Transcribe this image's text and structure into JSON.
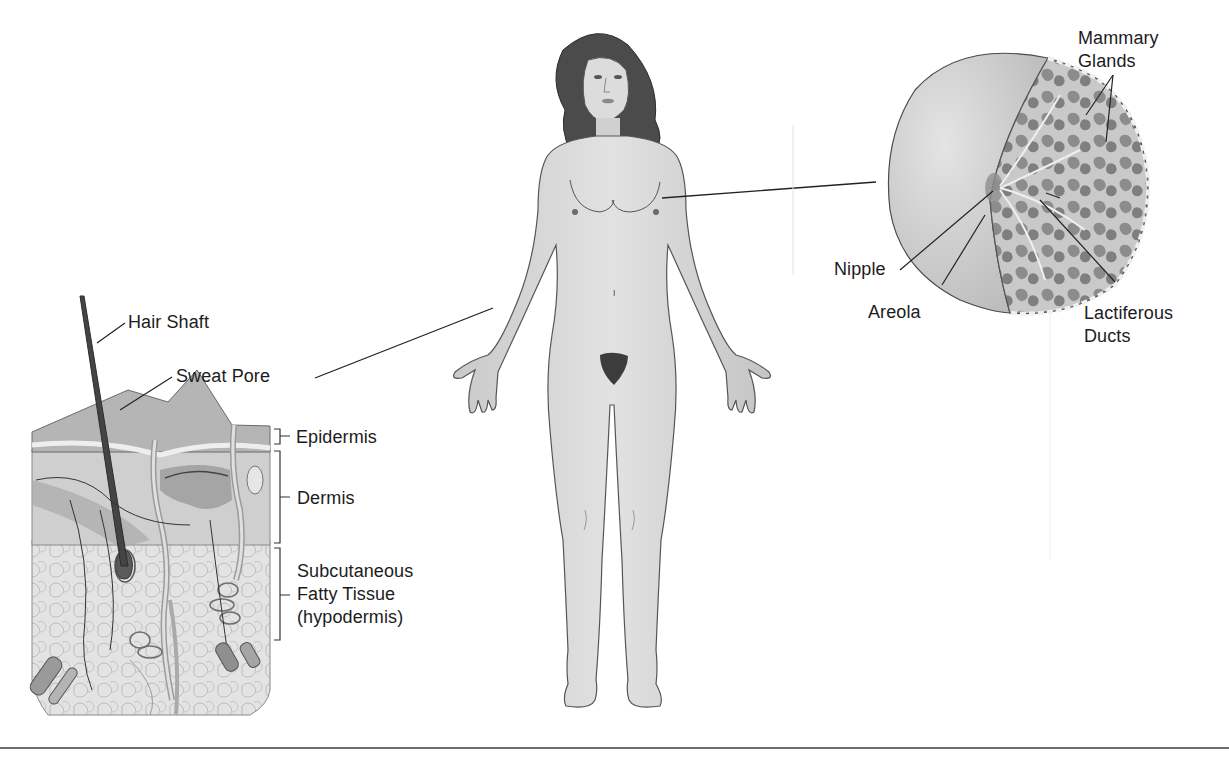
{
  "diagram": {
    "topic": "Integumentary system (female figure) with skin cross-section and mammary gland detail",
    "colors": {
      "skin": "#d6d6d6",
      "skin_shadow": "#b9b9b9",
      "outline": "#4a4a4a",
      "hair": "#3d3d3d",
      "gland": "#8a8a8a",
      "leader_line": "#222222",
      "rule": "#6d6d6d"
    },
    "skin_section": {
      "labels": {
        "hair_shaft": "Hair Shaft",
        "sweat_pore": "Sweat Pore",
        "epidermis": "Epidermis",
        "dermis": "Dermis",
        "hypodermis_line1": "Subcutaneous",
        "hypodermis_line2": "Fatty Tissue",
        "hypodermis_line3": "(hypodermis)"
      }
    },
    "breast_section": {
      "labels": {
        "mammary_line1": "Mammary",
        "mammary_line2": "Glands",
        "nipple": "Nipple",
        "areola": "Areola",
        "ducts_line1": "Lactiferous",
        "ducts_line2": "Ducts"
      }
    },
    "body_figure": {
      "name": "Female anterior view"
    }
  }
}
